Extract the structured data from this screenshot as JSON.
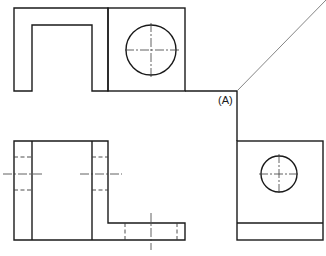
{
  "drawing": {
    "type": "orthographic-projection",
    "views": [
      "top-view",
      "front-view",
      "side-view"
    ],
    "labels": {
      "point_a": "(A)"
    },
    "colors": {
      "line": "#1a1a1a",
      "background": "#ffffff"
    }
  }
}
